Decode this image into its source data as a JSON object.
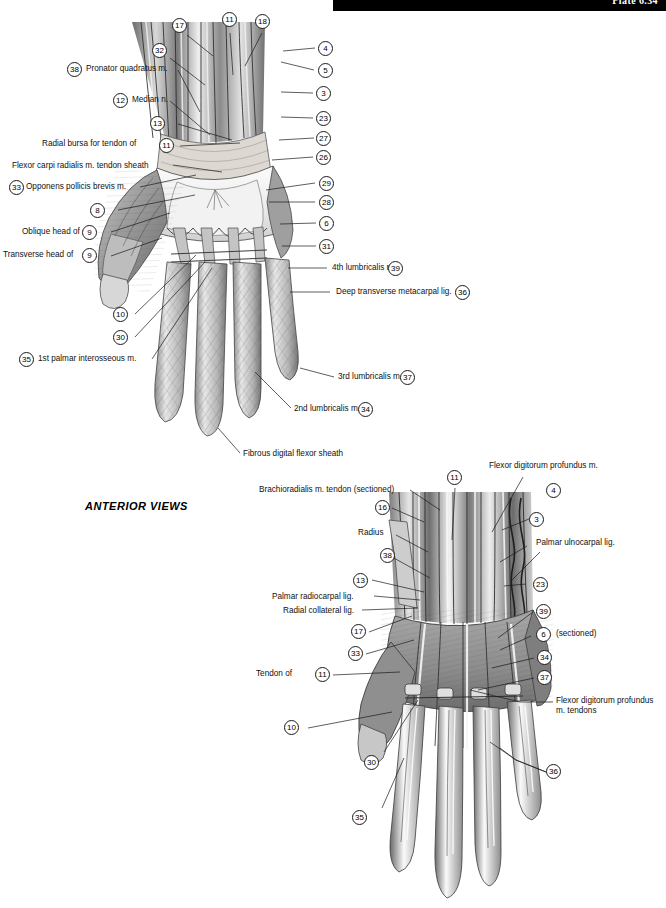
{
  "page": {
    "banner_text": "Plate 6.34",
    "view_caption": "ANTERIOR VIEWS",
    "background": "#ffffff",
    "ink": "#1a1a1a"
  },
  "figure_top": {
    "name": "palm-of-hand-superficial-dissection",
    "labels_left": [
      {
        "num": "38",
        "text": "Pronator quadratus m."
      },
      {
        "num": "12",
        "text": "Median n."
      },
      {
        "num": "13",
        "text": ""
      },
      {
        "num": "11",
        "text": "Radial bursa for tendon of"
      },
      {
        "num": "",
        "text": "Flexor carpi radialis m. tendon sheath"
      },
      {
        "num": "33",
        "text": "Opponens pollicis brevis m."
      },
      {
        "num": "8",
        "text": ""
      },
      {
        "num": "9",
        "text": "Oblique head of"
      },
      {
        "num": "9",
        "text": "Transverse head of"
      },
      {
        "num": "10",
        "text": ""
      },
      {
        "num": "30",
        "text": ""
      },
      {
        "num": "35",
        "text": "1st palmar interosseous m."
      }
    ],
    "labels_top": [
      {
        "num": "17",
        "text": ""
      },
      {
        "num": "11",
        "text": ""
      },
      {
        "num": "18",
        "text": ""
      },
      {
        "num": "32",
        "text": ""
      }
    ],
    "labels_right": [
      {
        "num": "4",
        "text": ""
      },
      {
        "num": "5",
        "text": ""
      },
      {
        "num": "3",
        "text": ""
      },
      {
        "num": "23",
        "text": ""
      },
      {
        "num": "27",
        "text": ""
      },
      {
        "num": "26",
        "text": ""
      },
      {
        "num": "29",
        "text": ""
      },
      {
        "num": "28",
        "text": ""
      },
      {
        "num": "6",
        "text": ""
      },
      {
        "num": "31",
        "text": ""
      },
      {
        "num": "39",
        "text": "4th lumbricalis m."
      },
      {
        "num": "36",
        "text": "Deep transverse metacarpal lig."
      },
      {
        "num": "37",
        "text": "3rd lumbricalis m."
      },
      {
        "num": "34",
        "text": "2nd lumbricalis m."
      },
      {
        "num": "",
        "text": "Fibrous digital flexor sheath"
      }
    ]
  },
  "figure_bottom": {
    "name": "wrist-and-hand-deep-dissection",
    "labels_left": [
      {
        "num": "",
        "text": "Brachioradialis m. tendon (sectioned)"
      },
      {
        "num": "16",
        "text": ""
      },
      {
        "num": "",
        "text": "Radius"
      },
      {
        "num": "38",
        "text": ""
      },
      {
        "num": "13",
        "text": ""
      },
      {
        "num": "",
        "text": "Palmar radiocarpal lig."
      },
      {
        "num": "",
        "text": "Radial collateral lig."
      },
      {
        "num": "17",
        "text": ""
      },
      {
        "num": "33",
        "text": ""
      },
      {
        "num": "11",
        "text": "Tendon of"
      },
      {
        "num": "10",
        "text": ""
      },
      {
        "num": "30",
        "text": ""
      },
      {
        "num": "35",
        "text": ""
      }
    ],
    "labels_top": [
      {
        "num": "11",
        "text": ""
      },
      {
        "num": "",
        "text": "Flexor digitorum profundus m."
      }
    ],
    "labels_right": [
      {
        "num": "4",
        "text": ""
      },
      {
        "num": "3",
        "text": ""
      },
      {
        "num": "",
        "text": "Palmar ulnocarpal lig."
      },
      {
        "num": "23",
        "text": ""
      },
      {
        "num": "39",
        "text": ""
      },
      {
        "num": "6",
        "text": "(sectioned)"
      },
      {
        "num": "34",
        "text": ""
      },
      {
        "num": "37",
        "text": ""
      },
      {
        "num": "",
        "text": "Flexor digitorum profundus m. tendons"
      },
      {
        "num": "36",
        "text": ""
      }
    ]
  }
}
